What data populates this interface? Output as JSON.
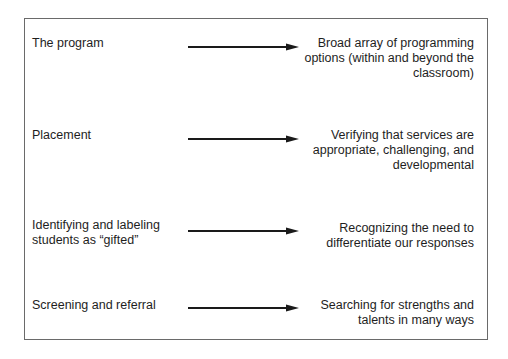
{
  "diagram": {
    "rows": [
      {
        "from": "The program",
        "to": "Broad array of programming\noptions (within and beyond the\nclassroom)"
      },
      {
        "from": "Placement",
        "to": "Verifying that services are\nappropriate, challenging, and\ndevelopmental"
      },
      {
        "from": "Identifying and labeling\nstudents as “gifted”",
        "to": "Recognizing the need to\ndifferentiate our responses"
      },
      {
        "from": "Screening and referral",
        "to": "Searching for strengths and\ntalents in many ways"
      }
    ],
    "colors": {
      "border": "#6a6a6a",
      "arrow": "#1a1a1a",
      "text": "#1e1e1e",
      "background": "#ffffff"
    }
  }
}
